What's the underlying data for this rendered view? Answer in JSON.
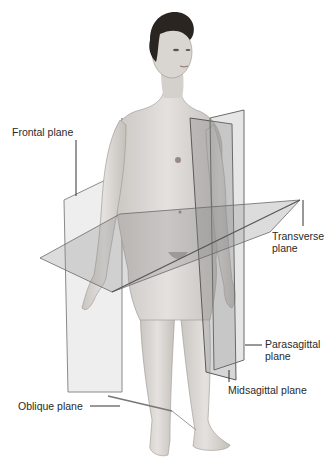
{
  "figure": {
    "colors": {
      "background": "#ffffff",
      "skin": "#d9d6d2",
      "plane_fill": "#9a9a9a",
      "plane_edge": "#555555",
      "hair": "#2b2522",
      "label_text": "#2a2a2a"
    }
  },
  "labels": {
    "frontal": "Frontal plane",
    "transverse_line1": "Transverse",
    "transverse_line2": "plane",
    "parasagittal_line1": "Parasagittal",
    "parasagittal_line2": "plane",
    "midsagittal": "Midsagittal plane",
    "oblique": "Oblique plane"
  }
}
